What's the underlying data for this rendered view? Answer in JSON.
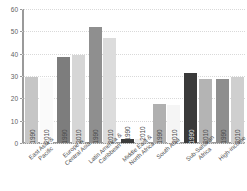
{
  "title_strip": "",
  "chart_data": {
    "type": "bar",
    "title": "",
    "subtitle": "",
    "xlabel": "",
    "ylabel": "",
    "ylim": [
      0,
      60
    ],
    "yticks": [
      0,
      10,
      20,
      30,
      40,
      50,
      60
    ],
    "ytick_labels": [
      "0",
      "10",
      "20",
      "30",
      "40",
      "50",
      "60"
    ],
    "grid": true,
    "legend": "none",
    "series_labels": [
      "1990",
      "2010"
    ],
    "categories": [
      "East Asia &\nPacific",
      "Europe &\nCentral Asia",
      "Latin America &\nCaribbean",
      "Middle East &\nNorth Africa",
      "South Asia",
      "Sub-Saharan\nAfrica",
      "High-income"
    ],
    "series": [
      {
        "name": "1990",
        "values": [
          29.5,
          38.5,
          52.0,
          2.0,
          17.5,
          31.5,
          28.5
        ]
      },
      {
        "name": "2010",
        "values": [
          29.3,
          39.5,
          47.0,
          1.8,
          17.2,
          28.5,
          29.5
        ]
      }
    ],
    "bars": [
      {
        "category": "East Asia &\nPacific",
        "year": "1990",
        "value": 29.5,
        "color": "#c6c6c6"
      },
      {
        "category": "East Asia &\nPacific",
        "year": "2010",
        "value": 29.3,
        "color": "#fafafa"
      },
      {
        "category": "Europe &\nCentral Asia",
        "year": "1990",
        "value": 38.5,
        "color": "#7d7d7d"
      },
      {
        "category": "Europe &\nCentral Asia",
        "year": "2010",
        "value": 39.5,
        "color": "#d6d6d6"
      },
      {
        "category": "Latin America &\nCaribbean",
        "year": "1990",
        "value": 52.0,
        "color": "#8f8f8f"
      },
      {
        "category": "Latin America &\nCaribbean",
        "year": "2010",
        "value": 47.0,
        "color": "#dcdcdc"
      },
      {
        "category": "Middle East &\nNorth Africa",
        "year": "1990",
        "value": 2.0,
        "color": "#3c3c3c"
      },
      {
        "category": "Middle East &\nNorth Africa",
        "year": "2010",
        "value": 1.8,
        "color": "#ededed"
      },
      {
        "category": "South Asia",
        "year": "1990",
        "value": 17.5,
        "color": "#b0b0b0"
      },
      {
        "category": "South Asia",
        "year": "2010",
        "value": 17.2,
        "color": "#f5f5f5"
      },
      {
        "category": "Sub-Saharan\nAfrica",
        "year": "1990",
        "value": 31.5,
        "color": "#3a3a3a"
      },
      {
        "category": "Sub-Saharan\nAfrica",
        "year": "2010",
        "value": 28.5,
        "color": "#b4b4b4"
      },
      {
        "category": "High-income",
        "year": "1990",
        "value": 28.5,
        "color": "#8e8e8e"
      },
      {
        "category": "High-income",
        "year": "2010",
        "value": 29.5,
        "color": "#cfcfcf"
      }
    ]
  },
  "style": {
    "axis_color": "#9a9a9a",
    "grid_color": "#d9d9d9",
    "tick_text_color": "#5f5f5f",
    "label_text_color": "#4f4f4f",
    "background": "#ffffff"
  }
}
